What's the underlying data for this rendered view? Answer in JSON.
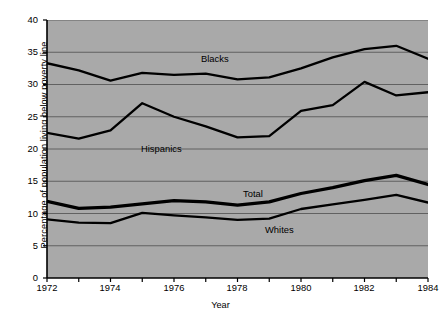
{
  "chart_data": {
    "type": "line",
    "title": "",
    "xlabel": "Year",
    "ylabel": "Percentage of population living below poverty line",
    "xlim": [
      1972,
      1984
    ],
    "ylim": [
      0,
      40
    ],
    "grid": true,
    "legend_position": "inline-labels",
    "x": [
      1972,
      1973,
      1974,
      1975,
      1976,
      1977,
      1978,
      1979,
      1980,
      1981,
      1982,
      1983,
      1984
    ],
    "x_tick_labels": [
      "1972",
      "1974",
      "1976",
      "1978",
      "1980",
      "1982",
      "1984"
    ],
    "y_tick_labels": [
      "0",
      "5",
      "10",
      "15",
      "20",
      "25",
      "30",
      "35",
      "40"
    ],
    "series": [
      {
        "name": "Blacks",
        "label": "Blacks",
        "color": "#000000",
        "line_width": 2.3,
        "values": [
          33.3,
          32.2,
          30.6,
          31.8,
          31.5,
          31.7,
          30.8,
          31.1,
          32.5,
          34.2,
          35.5,
          36.0,
          34.0
        ]
      },
      {
        "name": "Hispanics",
        "label": "Hispanics",
        "color": "#000000",
        "line_width": 2.3,
        "values": [
          22.5,
          21.6,
          22.9,
          27.1,
          25.0,
          23.5,
          21.8,
          22.0,
          25.9,
          26.8,
          30.4,
          28.3,
          28.8
        ]
      },
      {
        "name": "Total",
        "label": "Total",
        "color": "#000000",
        "line_width": 3.3,
        "values": [
          11.9,
          10.8,
          11.0,
          11.5,
          12.0,
          11.8,
          11.3,
          11.8,
          13.1,
          14.0,
          15.1,
          15.9,
          14.5
        ]
      },
      {
        "name": "Whites",
        "label": "Whites",
        "color": "#000000",
        "line_width": 2.3,
        "values": [
          9.1,
          8.6,
          8.5,
          10.1,
          9.7,
          9.4,
          9.0,
          9.2,
          10.7,
          11.4,
          12.1,
          12.9,
          11.7
        ]
      }
    ]
  },
  "axis": {
    "y_title": "Percentage of population living below poverty line",
    "x_title": "Year",
    "y_ticks": [
      "40",
      "35",
      "30",
      "25",
      "20",
      "15",
      "10",
      "5",
      "0"
    ],
    "x_ticks": [
      "1972",
      "1974",
      "1976",
      "1978",
      "1980",
      "1982",
      "1984"
    ]
  },
  "labels": {
    "blacks": "Blacks",
    "hispanics": "Hispanics",
    "total": "Total",
    "whites": "Whites"
  },
  "caption": {
    "text": ""
  },
  "colors": {
    "plot_background": "#a9a9a9",
    "page_background": "#ffffff",
    "line": "#000000",
    "gridline": "#4f4f4f"
  }
}
